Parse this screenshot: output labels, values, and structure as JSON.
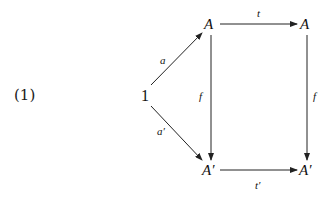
{
  "equation_number": "(1)",
  "diagram": {
    "nodes": {
      "one": "1",
      "top_left": "A",
      "top_right": "A",
      "bottom_left": "A′",
      "bottom_right": "A′"
    },
    "edges": {
      "a": "a",
      "a_prime": "a′",
      "t": "t",
      "t_prime": "t′",
      "f_left": "f",
      "f_right": "f"
    }
  }
}
